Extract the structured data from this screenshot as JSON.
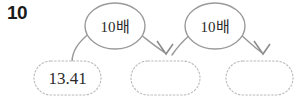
{
  "problem": {
    "number": "10"
  },
  "diagram": {
    "type": "flow",
    "boxes": [
      {
        "id": "box-1",
        "value": "13.41",
        "filled": true
      },
      {
        "id": "box-2",
        "value": "",
        "filled": false
      },
      {
        "id": "box-3",
        "value": "",
        "filled": false
      }
    ],
    "operations": [
      {
        "id": "op-1",
        "label": "10배"
      },
      {
        "id": "op-2",
        "label": "10배"
      }
    ],
    "colors": {
      "stroke": "#9a9a9a",
      "dotted_stroke": "#b9b9b9",
      "arrow": "#8d8d8d",
      "text": "#2b2b2b",
      "number": "#1b1b1b",
      "background": "#ffffff"
    }
  }
}
